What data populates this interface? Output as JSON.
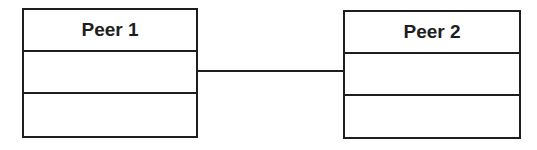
{
  "diagram": {
    "type": "uml-class-association",
    "nodes": [
      {
        "id": "peer1",
        "title": "Peer 1",
        "compartments": [
          "",
          ""
        ]
      },
      {
        "id": "peer2",
        "title": "Peer 2",
        "compartments": [
          "",
          ""
        ]
      }
    ],
    "edges": [
      {
        "from": "peer1",
        "to": "peer2",
        "style": "solid-line",
        "label": ""
      }
    ],
    "colors": {
      "stroke": "#1e1e1e",
      "background": "#ffffff",
      "text": "#1e1e1e"
    }
  }
}
